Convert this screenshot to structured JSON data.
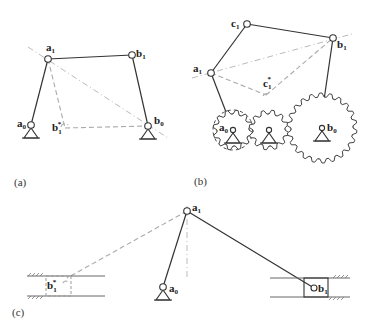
{
  "figure": {
    "panels": [
      {
        "caption": "(a)",
        "labels": {
          "a1": {
            "main": "a",
            "sub": "1"
          },
          "b1": {
            "main": "b",
            "sub": "1"
          },
          "a0": {
            "main": "a",
            "sub": "0"
          },
          "b0": {
            "main": "b",
            "sub": "0"
          },
          "b1star": {
            "main": "b",
            "sub": "1",
            "sup": "*"
          }
        }
      },
      {
        "caption": "(b)",
        "labels": {
          "c1": {
            "main": "c",
            "sub": "1"
          },
          "a1": {
            "main": "a",
            "sub": "1"
          },
          "b1": {
            "main": "b",
            "sub": "1"
          },
          "c1star": {
            "main": "c",
            "sub": "1",
            "sup": "*"
          },
          "a0": {
            "main": "a",
            "sub": "0"
          },
          "b0": {
            "main": "b",
            "sub": "0"
          }
        }
      },
      {
        "caption": "(c)",
        "labels": {
          "a1": {
            "main": "a",
            "sub": "1"
          },
          "a0": {
            "main": "a",
            "sub": "0"
          },
          "b1": {
            "main": "b",
            "sub": "1"
          },
          "b1star": {
            "main": "b",
            "sub": "1",
            "sup": "*"
          }
        }
      }
    ]
  }
}
